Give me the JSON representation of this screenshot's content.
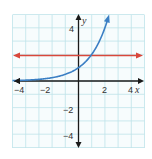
{
  "chart_data": {
    "type": "line",
    "title": "",
    "xlabel": "x",
    "ylabel": "y",
    "xlim": [
      -5,
      5
    ],
    "ylim": [
      -5,
      5
    ],
    "grid": true,
    "x_ticks": [
      -4,
      -2,
      2,
      4
    ],
    "y_ticks": [
      4,
      -2,
      -4
    ],
    "x_tick_labels": [
      "−4",
      "−2",
      "2",
      "4"
    ],
    "y_tick_labels": [
      "4",
      "−2",
      "−4"
    ],
    "series": [
      {
        "name": "y = 2^x",
        "kind": "exponential",
        "color": "#3b7fc4",
        "points": [
          [
            -5,
            0.03
          ],
          [
            -4,
            0.06
          ],
          [
            -3,
            0.13
          ],
          [
            -2,
            0.25
          ],
          [
            -1,
            0.5
          ],
          [
            0,
            1
          ],
          [
            1,
            2
          ],
          [
            1.5,
            2.83
          ],
          [
            2,
            4
          ],
          [
            2.3,
            4.9
          ]
        ]
      },
      {
        "name": "y = 2",
        "kind": "horizontal-line",
        "color": "#d9473b",
        "points": [
          [
            -5,
            2
          ],
          [
            5,
            2
          ]
        ]
      }
    ],
    "legend": null
  },
  "colors": {
    "grid": "#bfe3ea",
    "axis": "#1a1a1a",
    "curve": "#3b7fc4",
    "line": "#d9473b"
  },
  "labels": {
    "x_axis": "x",
    "y_axis": "y",
    "xt_m4": "−4",
    "xt_m2": "−2",
    "xt_2": "2",
    "xt_4": "4",
    "yt_4": "4",
    "yt_m2": "−2",
    "yt_m4": "−4"
  }
}
